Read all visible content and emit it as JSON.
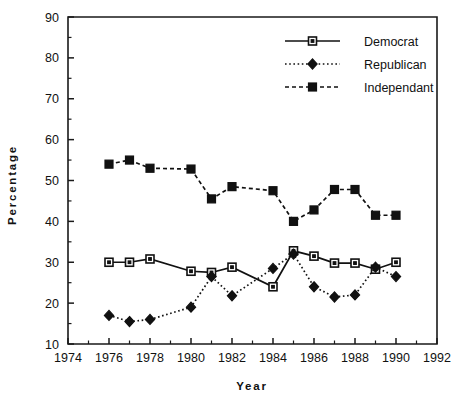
{
  "chart_data": {
    "type": "line",
    "title": "",
    "xlabel": "Year",
    "ylabel": "Percentage",
    "xlim": [
      1974,
      1992
    ],
    "ylim": [
      10,
      90
    ],
    "xticks": [
      1974,
      1976,
      1978,
      1980,
      1982,
      1984,
      1986,
      1988,
      1990,
      1992
    ],
    "yticks": [
      10,
      20,
      30,
      40,
      50,
      60,
      70,
      80,
      90
    ],
    "xtick_labels": [
      "1974",
      "1976",
      "1978",
      "1980",
      "1982",
      "1984",
      "1986",
      "1988",
      "1990",
      "1992"
    ],
    "ytick_labels": [
      "10",
      "20",
      "30",
      "40",
      "50",
      "60",
      "70",
      "80",
      "90"
    ],
    "minor_tick_step_x": 1,
    "minor_tick_step_y": 5,
    "grid": false,
    "legend_position": "top-center-right",
    "series": [
      {
        "name": "Democrat",
        "line_style": "solid",
        "marker": "open-square",
        "x": [
          1976,
          1977,
          1978,
          1980,
          1981,
          1982,
          1984,
          1985,
          1986,
          1987,
          1988,
          1989,
          1990
        ],
        "values": [
          30.0,
          30.0,
          30.8,
          27.8,
          27.5,
          28.8,
          24.0,
          32.8,
          31.5,
          29.8,
          29.8,
          28.3,
          30.0
        ]
      },
      {
        "name": "Republican",
        "line_style": "dotted",
        "marker": "filled-diamond",
        "x": [
          1976,
          1977,
          1978,
          1980,
          1981,
          1982,
          1984,
          1985,
          1986,
          1987,
          1988,
          1989,
          1990
        ],
        "values": [
          17.0,
          15.5,
          16.0,
          19.0,
          26.5,
          21.8,
          28.5,
          32.0,
          24.0,
          21.5,
          22.0,
          28.8,
          26.5
        ]
      },
      {
        "name": "Independant",
        "line_style": "dashed",
        "marker": "filled-square",
        "x": [
          1976,
          1977,
          1978,
          1980,
          1981,
          1982,
          1984,
          1985,
          1986,
          1987,
          1988,
          1989,
          1990
        ],
        "values": [
          54.0,
          55.0,
          53.0,
          52.8,
          45.5,
          48.5,
          47.5,
          40.0,
          42.8,
          47.8,
          47.8,
          41.5,
          41.5
        ]
      }
    ]
  },
  "legend": {
    "entries": [
      {
        "label": "Democrat"
      },
      {
        "label": "Republican"
      },
      {
        "label": "Independant"
      }
    ]
  }
}
